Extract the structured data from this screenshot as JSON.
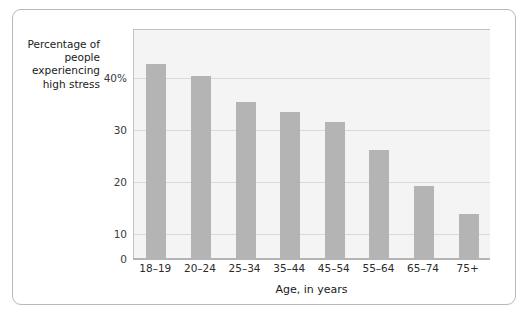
{
  "chart_data": {
    "type": "bar",
    "title": "",
    "subtitle": "",
    "xlabel": "Age, in years",
    "ylabel": "Percentage of people experiencing high stress",
    "ylabel_lines": [
      "Percentage of",
      "people",
      "experiencing",
      "high stress"
    ],
    "categories": [
      "18–19",
      "20–24",
      "25–34",
      "35–44",
      "45–54",
      "55–64",
      "65–74",
      "75+"
    ],
    "values": [
      37.3,
      35.0,
      30.0,
      28.2,
      26.3,
      20.8,
      13.9,
      8.6
    ],
    "ylim": [
      0,
      44
    ],
    "yticks": [
      0,
      10,
      20,
      30,
      40
    ],
    "ytick_labels": [
      "0",
      "10",
      "20",
      "30",
      "40%"
    ],
    "grid": true,
    "grid_axis": "y",
    "legend": "none",
    "colors": {
      "bar": "#b4b4b4",
      "plot_background": "#f4f4f4",
      "gridline": "#d9d9d9",
      "axis": "#b4b4b4",
      "frame_border": "#b9b9b9",
      "text": "#1a1a1a",
      "page_background": "#ffffff"
    }
  }
}
